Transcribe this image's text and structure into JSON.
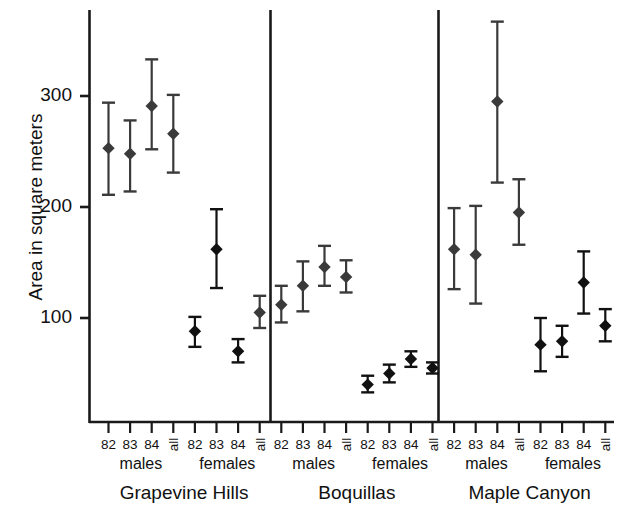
{
  "figure": {
    "caption_visible": false,
    "background": "#ffffff",
    "axis_color": "#1a1a1a",
    "marker_color": "#3a3a3a",
    "marker_color_dark": "#111111"
  },
  "axes": {
    "ylabel": "Area in square meters",
    "yticks": [
      100,
      200,
      300
    ],
    "ytick_labels": [
      "100",
      "200",
      "300"
    ],
    "ylim": [
      0,
      345
    ],
    "ymin_pixel_value": 0,
    "grid": false
  },
  "groups": {
    "years": [
      "82",
      "83",
      "84"
    ],
    "all_label": "all",
    "sexes": [
      "males",
      "females"
    ],
    "sites": [
      "Grapevine Hills",
      "Boquillas",
      "Maple Canyon"
    ]
  },
  "chart_data": {
    "type": "scatter",
    "title": "",
    "xlabel": "",
    "ylabel": "Area in square meters",
    "ylim": [
      0,
      345
    ],
    "yticks": [
      100,
      200,
      300
    ],
    "grid": false,
    "legend": "none",
    "error_bars": "vertical, capped (95% confidence interval)",
    "categories": [
      "Grapevine Hills males 82",
      "Grapevine Hills males 83",
      "Grapevine Hills males 84",
      "Grapevine Hills males all",
      "Grapevine Hills females 82",
      "Grapevine Hills females 83",
      "Grapevine Hills females 84",
      "Grapevine Hills females all",
      "Boquillas males 82",
      "Boquillas males 83",
      "Boquillas males 84",
      "Boquillas males all",
      "Boquillas females 82",
      "Boquillas females 83",
      "Boquillas females 84",
      "Boquillas females all",
      "Maple Canyon males 82",
      "Maple Canyon males 83",
      "Maple Canyon males 84",
      "Maple Canyon males all",
      "Maple Canyon females 82",
      "Maple Canyon females 83",
      "Maple Canyon females 84",
      "Maple Canyon females all"
    ],
    "points": [
      {
        "site": "Grapevine Hills",
        "sex": "males",
        "year": "82",
        "value": 253,
        "low": 211,
        "high": 294,
        "color": "#3a3a3a"
      },
      {
        "site": "Grapevine Hills",
        "sex": "males",
        "year": "83",
        "value": 248,
        "low": 214,
        "high": 278,
        "color": "#3a3a3a"
      },
      {
        "site": "Grapevine Hills",
        "sex": "males",
        "year": "84",
        "value": 291,
        "low": 252,
        "high": 333,
        "color": "#3a3a3a"
      },
      {
        "site": "Grapevine Hills",
        "sex": "males",
        "year": "all",
        "value": 266,
        "low": 231,
        "high": 301,
        "color": "#3a3a3a"
      },
      {
        "site": "Grapevine Hills",
        "sex": "females",
        "year": "82",
        "value": 88,
        "low": 74,
        "high": 101,
        "color": "#111111"
      },
      {
        "site": "Grapevine Hills",
        "sex": "females",
        "year": "83",
        "value": 162,
        "low": 127,
        "high": 198,
        "color": "#111111"
      },
      {
        "site": "Grapevine Hills",
        "sex": "females",
        "year": "84",
        "value": 70,
        "low": 60,
        "high": 81,
        "color": "#111111"
      },
      {
        "site": "Grapevine Hills",
        "sex": "females",
        "year": "all",
        "value": 105,
        "low": 91,
        "high": 120,
        "color": "#3a3a3a"
      },
      {
        "site": "Boquillas",
        "sex": "males",
        "year": "82",
        "value": 112,
        "low": 96,
        "high": 129,
        "color": "#3a3a3a"
      },
      {
        "site": "Boquillas",
        "sex": "males",
        "year": "83",
        "value": 129,
        "low": 106,
        "high": 151,
        "color": "#3a3a3a"
      },
      {
        "site": "Boquillas",
        "sex": "males",
        "year": "84",
        "value": 146,
        "low": 129,
        "high": 165,
        "color": "#3a3a3a"
      },
      {
        "site": "Boquillas",
        "sex": "males",
        "year": "all",
        "value": 137,
        "low": 123,
        "high": 152,
        "color": "#3a3a3a"
      },
      {
        "site": "Boquillas",
        "sex": "females",
        "year": "82",
        "value": 40,
        "low": 33,
        "high": 48,
        "color": "#111111"
      },
      {
        "site": "Boquillas",
        "sex": "females",
        "year": "83",
        "value": 50,
        "low": 42,
        "high": 58,
        "color": "#111111"
      },
      {
        "site": "Boquillas",
        "sex": "females",
        "year": "84",
        "value": 63,
        "low": 56,
        "high": 70,
        "color": "#111111"
      },
      {
        "site": "Boquillas",
        "sex": "females",
        "year": "all",
        "value": 55,
        "low": 50,
        "high": 60,
        "color": "#111111"
      },
      {
        "site": "Maple Canyon",
        "sex": "males",
        "year": "82",
        "value": 162,
        "low": 126,
        "high": 199,
        "color": "#3a3a3a"
      },
      {
        "site": "Maple Canyon",
        "sex": "males",
        "year": "83",
        "value": 157,
        "low": 113,
        "high": 201,
        "color": "#3a3a3a"
      },
      {
        "site": "Maple Canyon",
        "sex": "males",
        "year": "84",
        "value": 295,
        "low": 222,
        "high": 367,
        "color": "#3a3a3a"
      },
      {
        "site": "Maple Canyon",
        "sex": "males",
        "year": "all",
        "value": 195,
        "low": 166,
        "high": 225,
        "color": "#3a3a3a"
      },
      {
        "site": "Maple Canyon",
        "sex": "females",
        "year": "82",
        "value": 76,
        "low": 52,
        "high": 100,
        "color": "#111111"
      },
      {
        "site": "Maple Canyon",
        "sex": "females",
        "year": "83",
        "value": 79,
        "low": 65,
        "high": 93,
        "color": "#111111"
      },
      {
        "site": "Maple Canyon",
        "sex": "females",
        "year": "84",
        "value": 132,
        "low": 104,
        "high": 160,
        "color": "#111111"
      },
      {
        "site": "Maple Canyon",
        "sex": "females",
        "year": "all",
        "value": 93,
        "low": 79,
        "high": 108,
        "color": "#111111"
      }
    ]
  }
}
